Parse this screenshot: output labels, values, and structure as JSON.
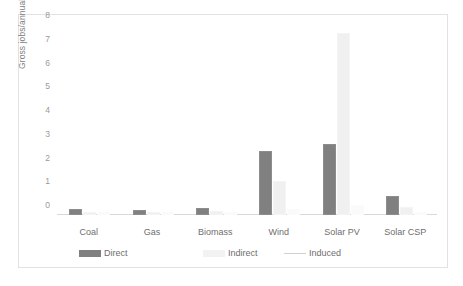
{
  "chart_data": {
    "type": "bar",
    "title": "",
    "xlabel": "",
    "ylabel": "Gross jobs/annual GWh",
    "ylim": [
      0,
      8
    ],
    "yticks": [
      0,
      1,
      2,
      3,
      4,
      5,
      6,
      7,
      8
    ],
    "grid": false,
    "legend_position": "bottom",
    "categories": [
      "Coal",
      "Gas",
      "Biomass",
      "Wind",
      "Solar PV",
      "Solar CSP"
    ],
    "series": [
      {
        "name": "Direct",
        "color": "#808080",
        "values": [
          0.15,
          0.13,
          0.21,
          2.6,
          2.9,
          0.7
        ]
      },
      {
        "name": "Indirect",
        "color": "#f0f0f0",
        "values": [
          0.04,
          0.05,
          0.08,
          1.35,
          7.6,
          0.25
        ]
      },
      {
        "name": "Induced",
        "color": "#fafafa",
        "values": [
          0.02,
          0.02,
          0.03,
          0.15,
          0.35,
          0.05
        ]
      }
    ]
  },
  "axis": {
    "ylabel": "Gross jobs/annual GWh",
    "tick_0": "0",
    "tick_1": "1",
    "tick_2": "2",
    "tick_3": "3",
    "tick_4": "4",
    "tick_5": "5",
    "tick_6": "6",
    "tick_7": "7",
    "tick_8": "8"
  },
  "categories": {
    "c0": "Coal",
    "c1": "Gas",
    "c2": "Biomass",
    "c3": "Wind",
    "c4": "Solar PV",
    "c5": "Solar CSP"
  },
  "legend": {
    "direct": "Direct",
    "indirect": "Indirect",
    "induced": "Induced"
  }
}
